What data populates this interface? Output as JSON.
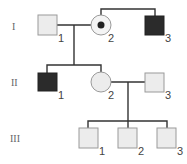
{
  "colors": {
    "unaffected_fill": "#ececec",
    "unaffected_stroke": "#9a9a9a",
    "affected_fill": "#2b2b2b",
    "line": "#333333",
    "carrier_dot": "#222222"
  },
  "generations": [
    {
      "label": "I",
      "individuals": [
        {
          "number": "1",
          "sex": "male",
          "status": "unaffected"
        },
        {
          "number": "2",
          "sex": "female",
          "status": "carrier"
        },
        {
          "number": "3",
          "sex": "male",
          "status": "affected"
        }
      ]
    },
    {
      "label": "II",
      "individuals": [
        {
          "number": "1",
          "sex": "male",
          "status": "affected"
        },
        {
          "number": "2",
          "sex": "female",
          "status": "unaffected"
        },
        {
          "number": "3",
          "sex": "male",
          "status": "unaffected"
        }
      ]
    },
    {
      "label": "III",
      "individuals": [
        {
          "number": "1",
          "sex": "male",
          "status": "unaffected"
        },
        {
          "number": "2",
          "sex": "male",
          "status": "unaffected"
        },
        {
          "number": "3",
          "sex": "male",
          "status": "unaffected"
        }
      ]
    }
  ],
  "relationships": [
    {
      "type": "mating",
      "partners": [
        "I-1",
        "I-2"
      ],
      "children": [
        "II-1",
        "II-2"
      ]
    },
    {
      "type": "sibling",
      "members": [
        "I-2",
        "I-3"
      ]
    },
    {
      "type": "mating",
      "partners": [
        "II-2",
        "II-3"
      ],
      "children": [
        "III-1",
        "III-2",
        "III-3"
      ]
    }
  ]
}
